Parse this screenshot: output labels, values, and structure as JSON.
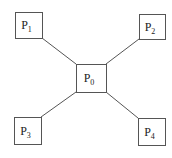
{
  "diagram": {
    "type": "star-topology",
    "colors": {
      "stroke": "#555555",
      "background": "#ffffff",
      "text": "#222222"
    },
    "nodes": [
      {
        "id": "P0",
        "base": "P",
        "sub": "0",
        "x": 76,
        "y": 64,
        "w": 30,
        "h": 28,
        "role": "center"
      },
      {
        "id": "P1",
        "base": "P",
        "sub": "1",
        "x": 15,
        "y": 12,
        "w": 27,
        "h": 26,
        "role": "top-left"
      },
      {
        "id": "P2",
        "base": "P",
        "sub": "2",
        "x": 139,
        "y": 14,
        "w": 26,
        "h": 25,
        "role": "top-right"
      },
      {
        "id": "P3",
        "base": "P",
        "sub": "3",
        "x": 14,
        "y": 117,
        "w": 27,
        "h": 27,
        "role": "bottom-left"
      },
      {
        "id": "P4",
        "base": "P",
        "sub": "4",
        "x": 138,
        "y": 118,
        "w": 27,
        "h": 27,
        "role": "bottom-right"
      }
    ],
    "edges": [
      {
        "from": "P1",
        "to": "P0",
        "x1": 42,
        "y1": 38,
        "x2": 76,
        "y2": 64
      },
      {
        "from": "P2",
        "to": "P0",
        "x1": 139,
        "y1": 39,
        "x2": 106,
        "y2": 64
      },
      {
        "from": "P3",
        "to": "P0",
        "x1": 41,
        "y1": 117,
        "x2": 76,
        "y2": 92
      },
      {
        "from": "P4",
        "to": "P0",
        "x1": 138,
        "y1": 118,
        "x2": 106,
        "y2": 92
      }
    ]
  }
}
